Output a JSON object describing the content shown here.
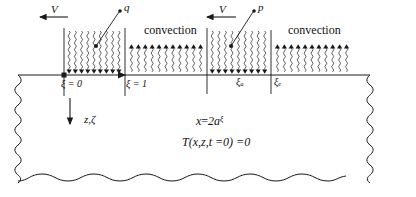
{
  "figure": {
    "type": "thermal-boundary-schematic",
    "background": "#ffffff",
    "line_color": "#1a1a1a"
  },
  "velocity_labels": [
    {
      "text": "V",
      "direction": "left",
      "x": 55,
      "y": 8
    },
    {
      "text": "V",
      "direction": "left",
      "x": 222,
      "y": 8
    }
  ],
  "source_labels": [
    {
      "text": "q",
      "dot": "̇",
      "x": 124,
      "y": 4,
      "leader_from_x": 98,
      "leader_from_y": 22
    },
    {
      "text": "p",
      "dot": "̇",
      "x": 258,
      "y": 4,
      "leader_from_x": 234,
      "leader_from_y": 22
    }
  ],
  "convection_labels": [
    {
      "text": "convection",
      "x": 146,
      "y": 28
    },
    {
      "text": "convection",
      "x": 289,
      "y": 28
    }
  ],
  "boundary_labels": [
    {
      "symbol": "ξ",
      "relation": "=",
      "value": "0",
      "subscript": "",
      "x": 61,
      "y": 80
    },
    {
      "symbol": "ξ",
      "relation": "=",
      "value": "1",
      "subscript": "",
      "x": 126,
      "y": 80
    },
    {
      "symbol": "ξ",
      "relation": "",
      "value": "",
      "subscript": "a",
      "x": 237,
      "y": 78
    },
    {
      "symbol": "ξ",
      "relation": "",
      "value": "",
      "subscript": "e",
      "x": 277,
      "y": 78
    }
  ],
  "axis_label": {
    "text": "z,ζ",
    "x": 84,
    "y": 118
  },
  "equations": [
    {
      "id": "x-definition",
      "lhs": "x",
      "rel": "=",
      "rhs_coef": "2a",
      "rhs_sym": "ξ",
      "rhs_is_sup": true,
      "x": 196,
      "y": 118
    },
    {
      "id": "initial-condition",
      "text": "T(x,z,t≠0)≠0",
      "display": "T(x,z,t =0) =0",
      "x": 182,
      "y": 139
    }
  ],
  "zones": {
    "flux_down_1": {
      "x0": 64,
      "x1": 124,
      "label": "heat-flux-zone-1"
    },
    "convection_1": {
      "x0": 126,
      "x1": 206,
      "label": "convection-zone-1"
    },
    "flux_down_2": {
      "x0": 207,
      "x1": 270,
      "label": "heat-flux-zone-2"
    },
    "convection_2": {
      "x0": 272,
      "x1": 352,
      "label": "convection-zone-2"
    }
  },
  "surface_line_y": 75,
  "body": {
    "left": 18,
    "right": 370,
    "bottom": 180
  }
}
